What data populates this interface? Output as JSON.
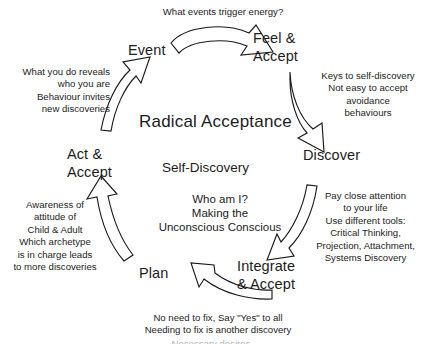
{
  "diagram": {
    "title": "Radical Acceptance",
    "subtitle": "Self-Discovery",
    "center_block": "Who am I?\nMaking the\nUnconscious Conscious",
    "colors": {
      "background": "#ffffff",
      "text": "#1c1c1c",
      "arrow_stroke": "#1a1a1a",
      "arrow_fill": "#ffffff"
    },
    "nodes": [
      {
        "id": "event",
        "label": "Event"
      },
      {
        "id": "feel-accept",
        "label": "Feel &\nAccept"
      },
      {
        "id": "discover",
        "label": "Discover"
      },
      {
        "id": "integrate-accept",
        "label": "Integrate\n& Accept"
      },
      {
        "id": "plan",
        "label": "Plan"
      },
      {
        "id": "act-accept",
        "label": "Act &\nAccept"
      }
    ],
    "annotations": [
      {
        "id": "event-to-feel",
        "text": "What events trigger energy?"
      },
      {
        "id": "feel-to-discover",
        "text": "Keys to self-discovery\nNot easy to accept\navoidance\nbehaviours"
      },
      {
        "id": "discover-to-integrate",
        "text": "Pay close attention\nto your life\nUse different tools:\nCritical Thinking,\nProjection, Attachment,\nSystems Discovery"
      },
      {
        "id": "integrate-to-plan",
        "text": "No need to fix, Say \"Yes\" to all\nNeeding to fix is another discovery"
      },
      {
        "id": "plan-to-act",
        "text": "Awareness of\nattitude of\nChild & Adult\nWhich archetype\nis in charge leads\nto more discoveries"
      },
      {
        "id": "act-to-event",
        "text": "What you do reveals\nwho you are\nBehaviour invites\nnew discoveries"
      }
    ],
    "footer_clipped": "Necessary desires"
  }
}
